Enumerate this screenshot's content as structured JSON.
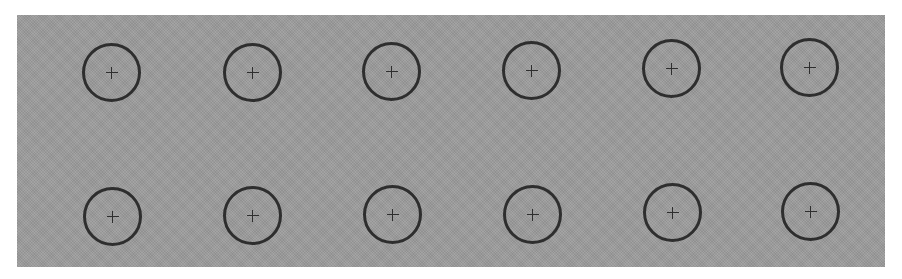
{
  "colors": {
    "page_background": "#ffffff",
    "panel_background": "#9b9b9b",
    "ring": "#2e2e2e"
  },
  "grid": {
    "rows": 2,
    "columns": 6,
    "icon": "plus-icon"
  },
  "targets": [
    {
      "row": 1,
      "col": 1,
      "x": 111,
      "y": 72
    },
    {
      "row": 1,
      "col": 2,
      "x": 252,
      "y": 72
    },
    {
      "row": 1,
      "col": 3,
      "x": 391,
      "y": 71
    },
    {
      "row": 1,
      "col": 4,
      "x": 531,
      "y": 70
    },
    {
      "row": 1,
      "col": 5,
      "x": 671,
      "y": 68
    },
    {
      "row": 1,
      "col": 6,
      "x": 809,
      "y": 67
    },
    {
      "row": 2,
      "col": 1,
      "x": 112,
      "y": 216
    },
    {
      "row": 2,
      "col": 2,
      "x": 252,
      "y": 215
    },
    {
      "row": 2,
      "col": 3,
      "x": 392,
      "y": 214
    },
    {
      "row": 2,
      "col": 4,
      "x": 532,
      "y": 214
    },
    {
      "row": 2,
      "col": 5,
      "x": 672,
      "y": 212
    },
    {
      "row": 2,
      "col": 6,
      "x": 810,
      "y": 211
    }
  ]
}
